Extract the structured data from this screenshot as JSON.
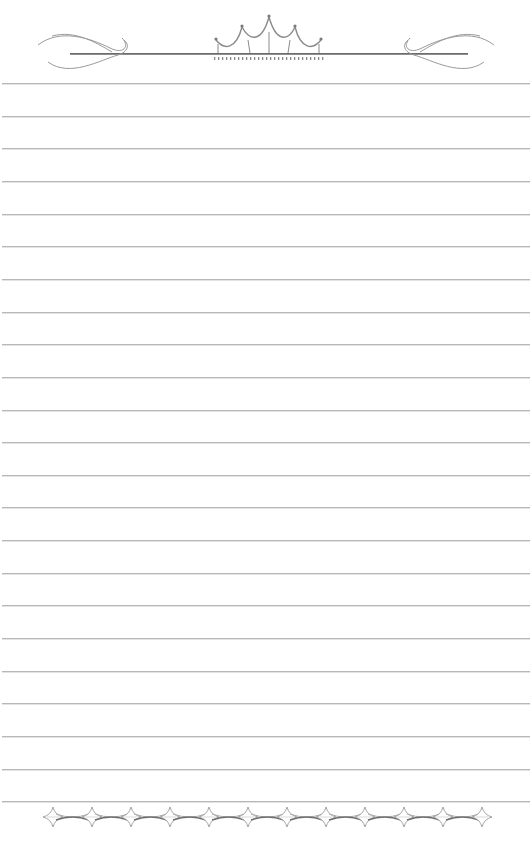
{
  "page": {
    "type": "lined-stationery",
    "background": "#ffffff",
    "line_color": "#b8b8b8",
    "ornament_color": "#9a9a9a"
  },
  "header": {
    "ornament": "crown-with-flourishes",
    "center_bar_y": 54
  },
  "ruled_lines": {
    "count": 23,
    "first_y": 83,
    "spacing": 32.65
  },
  "footer": {
    "ornament": "linked-diamond-stars",
    "star_count": 12
  }
}
